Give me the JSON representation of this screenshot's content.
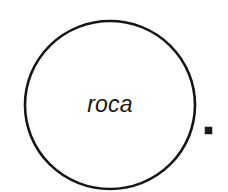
{
  "canvas": {
    "width": 228,
    "height": 192,
    "background_color": "#ffffff"
  },
  "figure": {
    "title": "roca",
    "shapes": [
      {
        "name": "circle-outline",
        "kind": "circle",
        "label": "roca",
        "stroke_color": "#161616",
        "fill_color": "#ffffff",
        "stroke_width": 2.6,
        "center_x": 110,
        "center_y": 105,
        "radius_x": 85,
        "radius_y": 84
      },
      {
        "name": "small-square-marker",
        "kind": "square",
        "label": "",
        "fill_color": "#1a1a1a",
        "stroke_color": "#1a1a1a",
        "x": 205,
        "y": 127,
        "size": 7
      }
    ]
  },
  "label": {
    "text": "roca",
    "color": "#181818",
    "font_size": "23px",
    "style": "italic",
    "center_x": 110,
    "baseline_y": 112
  }
}
